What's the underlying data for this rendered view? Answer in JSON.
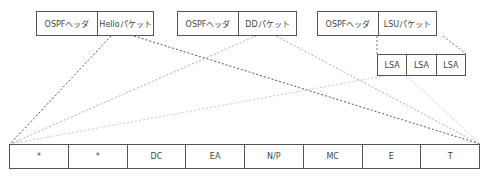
{
  "packets": [
    {
      "header": "OSPFヘッダ",
      "body": "Helloパケット",
      "line_color": "#555555"
    },
    {
      "header": "OSPFヘッダ",
      "body": "DDパケット",
      "line_color": "#8fa3b5"
    },
    {
      "header": "OSPFヘッダ",
      "body": "LSUパケット",
      "line_color": "#7f8c99"
    }
  ],
  "lsa": {
    "cells": [
      "LSA",
      "LSA",
      "LSA"
    ],
    "line_color": "#a9c4d8"
  },
  "options_field": {
    "cells": [
      "*",
      "*",
      "DC",
      "EA",
      "N/P",
      "MC",
      "E",
      "T"
    ]
  }
}
